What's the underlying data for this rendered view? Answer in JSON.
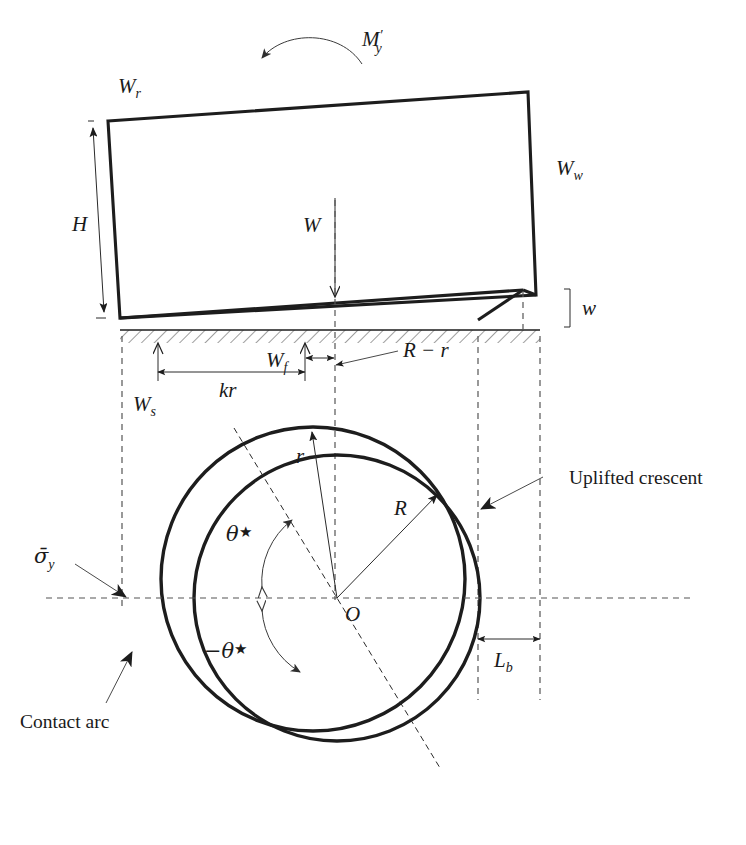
{
  "figure": {
    "domain": "diagram",
    "background_color": "#ffffff",
    "line_color": "#1d1d1d",
    "dashed_color": "#555555"
  },
  "elevation_view": {
    "moment_label": {
      "base": "M",
      "prime": "′",
      "subscript": "y"
    },
    "moment_arrow_direction": "counterclockwise-left",
    "roof_label": {
      "base": "W",
      "subscript": "r"
    },
    "wall_label": {
      "base": "W",
      "subscript": "w"
    },
    "height_label": {
      "base": "H",
      "subscript": ""
    },
    "weight_label": {
      "base": "W",
      "subscript": ""
    },
    "gap_label": {
      "base": "w",
      "subscript": ""
    },
    "ground_hatch_pattern": "diagonal-hatch"
  },
  "dimension_labels": {
    "soil_reaction": {
      "base": "W",
      "subscript": "s"
    },
    "foundation_reaction": {
      "base": "W",
      "subscript": "f"
    },
    "lever_arm": {
      "base": "kr",
      "subscript": ""
    },
    "radius_difference": {
      "base": "R − r",
      "subscript": ""
    },
    "bearing_length": {
      "base": "L",
      "subscript": "b"
    }
  },
  "plan_view": {
    "center_label": {
      "base": "O",
      "subscript": ""
    },
    "inner_radius_label": {
      "base": "r",
      "subscript": ""
    },
    "outer_radius_label": {
      "base": "R",
      "subscript": ""
    },
    "angle_positive_label": {
      "base": "θ",
      "star": "★"
    },
    "angle_negative_label": {
      "base": "−θ",
      "star": "★"
    },
    "stress_label": {
      "base": "σ̄",
      "subscript": "y"
    },
    "crescent_annotation": "Uplifted crescent",
    "contact_annotation": "Contact arc"
  },
  "geometry": {
    "outer_circle": {
      "cx": 337,
      "cy": 598,
      "r": 143
    },
    "inner_circle": {
      "cx": 313,
      "cy": 579,
      "r": 152
    },
    "ground_y": 330,
    "center_vline_x": 335,
    "left_vline_x": 122,
    "right_inner_vline_x": 478,
    "right_outer_vline_x": 540
  }
}
